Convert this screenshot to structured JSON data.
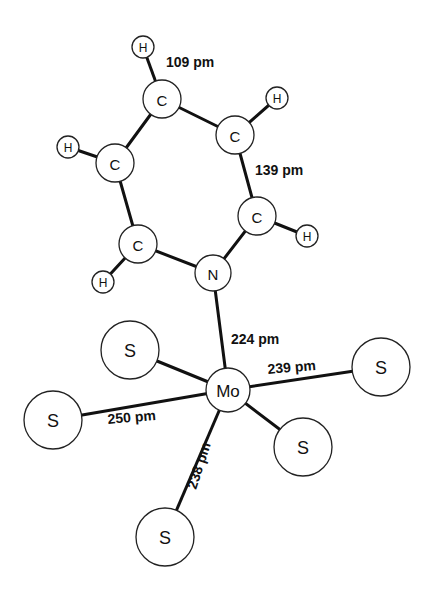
{
  "diagram": {
    "type": "molecular-structure",
    "atoms": [
      {
        "id": "Mo",
        "element": "Mo",
        "x": 228,
        "y": 390,
        "r": 22,
        "font": 17
      },
      {
        "id": "N",
        "element": "N",
        "x": 213,
        "y": 273,
        "r": 18,
        "font": 15
      },
      {
        "id": "C1",
        "element": "C",
        "x": 138,
        "y": 244,
        "r": 19,
        "font": 15
      },
      {
        "id": "C2",
        "element": "C",
        "x": 115,
        "y": 163,
        "r": 19,
        "font": 15
      },
      {
        "id": "C3",
        "element": "C",
        "x": 162,
        "y": 99,
        "r": 19,
        "font": 15
      },
      {
        "id": "C4",
        "element": "C",
        "x": 235,
        "y": 135,
        "r": 19,
        "font": 15
      },
      {
        "id": "C5",
        "element": "C",
        "x": 257,
        "y": 216,
        "r": 19,
        "font": 15
      },
      {
        "id": "H1",
        "element": "H",
        "x": 103,
        "y": 282,
        "r": 11,
        "font": 12
      },
      {
        "id": "H2",
        "element": "H",
        "x": 68,
        "y": 147,
        "r": 11,
        "font": 12
      },
      {
        "id": "H3",
        "element": "H",
        "x": 143,
        "y": 47,
        "r": 11,
        "font": 12
      },
      {
        "id": "H4",
        "element": "H",
        "x": 277,
        "y": 98,
        "r": 11,
        "font": 12
      },
      {
        "id": "H5",
        "element": "H",
        "x": 307,
        "y": 236,
        "r": 11,
        "font": 12
      },
      {
        "id": "S1",
        "element": "S",
        "x": 130,
        "y": 350,
        "r": 29,
        "font": 18
      },
      {
        "id": "S2",
        "element": "S",
        "x": 53,
        "y": 420,
        "r": 29,
        "font": 18
      },
      {
        "id": "S3",
        "element": "S",
        "x": 381,
        "y": 367,
        "r": 29,
        "font": 18
      },
      {
        "id": "S4",
        "element": "S",
        "x": 303,
        "y": 447,
        "r": 29,
        "font": 18
      },
      {
        "id": "S5",
        "element": "S",
        "x": 165,
        "y": 537,
        "r": 29,
        "font": 18
      }
    ],
    "bonds": [
      {
        "from": "N",
        "to": "C1"
      },
      {
        "from": "C1",
        "to": "C2"
      },
      {
        "from": "C2",
        "to": "C3"
      },
      {
        "from": "C3",
        "to": "C4"
      },
      {
        "from": "C4",
        "to": "C5"
      },
      {
        "from": "C5",
        "to": "N"
      },
      {
        "from": "C1",
        "to": "H1"
      },
      {
        "from": "C2",
        "to": "H2"
      },
      {
        "from": "C3",
        "to": "H3"
      },
      {
        "from": "C4",
        "to": "H4"
      },
      {
        "from": "C5",
        "to": "H5"
      },
      {
        "from": "N",
        "to": "Mo"
      },
      {
        "from": "Mo",
        "to": "S1"
      },
      {
        "from": "Mo",
        "to": "S2"
      },
      {
        "from": "Mo",
        "to": "S3"
      },
      {
        "from": "Mo",
        "to": "S4"
      },
      {
        "from": "Mo",
        "to": "S5"
      }
    ],
    "bond_labels": {
      "ch": {
        "text": "109 pm",
        "x": 166,
        "y": 67,
        "rotate": 0
      },
      "cc": {
        "text": "139 pm",
        "x": 255,
        "y": 175,
        "rotate": 0
      },
      "mo_n": {
        "text": "224 pm",
        "x": 231,
        "y": 344,
        "rotate": 0
      },
      "mo_s_right": {
        "text": "239 pm",
        "x": 268,
        "y": 374,
        "rotate": -5
      },
      "mo_s_left": {
        "text": "250 pm",
        "x": 108,
        "y": 424,
        "rotate": -5
      },
      "mo_s_bottom": {
        "text": "238 pm",
        "x": 196,
        "y": 490,
        "rotate": -72
      }
    }
  }
}
